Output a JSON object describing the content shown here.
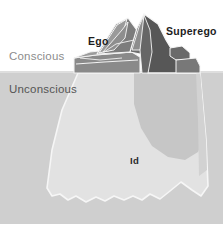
{
  "figure": {
    "kind": "freudian-iceberg-diagram",
    "width": 223,
    "height": 233
  },
  "regions": {
    "air": {
      "name": "Conscious region (above water)",
      "color": "#ffffff"
    },
    "water": {
      "name": "Unconscious region (below water)",
      "color": "#cfcfcf"
    },
    "frame": {
      "color": "#ffffff"
    }
  },
  "labels": {
    "conscious": "Conscious",
    "unconscious": "Unconscious",
    "ego": "Ego",
    "superego": "Superego",
    "id": "Id"
  },
  "colors": {
    "sky": "#ffffff",
    "water": "#cfcfcf",
    "peak_dark": "#6e6e6e",
    "peak_darker": "#5a5a5a",
    "peak_mid": "#8a8a8a",
    "peak_light": "#9d9d9d",
    "submerged_light": "#e0e0e0",
    "submerged_shadow": "#c2c2c2",
    "outline": "#f2f2f2",
    "text_conscious": "#8c8c8c",
    "text_unconscious": "#555555",
    "text_bold": "#1d1d1d"
  },
  "geometry": {
    "waterline_y": 72,
    "image_bottom_frame_y": 224
  }
}
